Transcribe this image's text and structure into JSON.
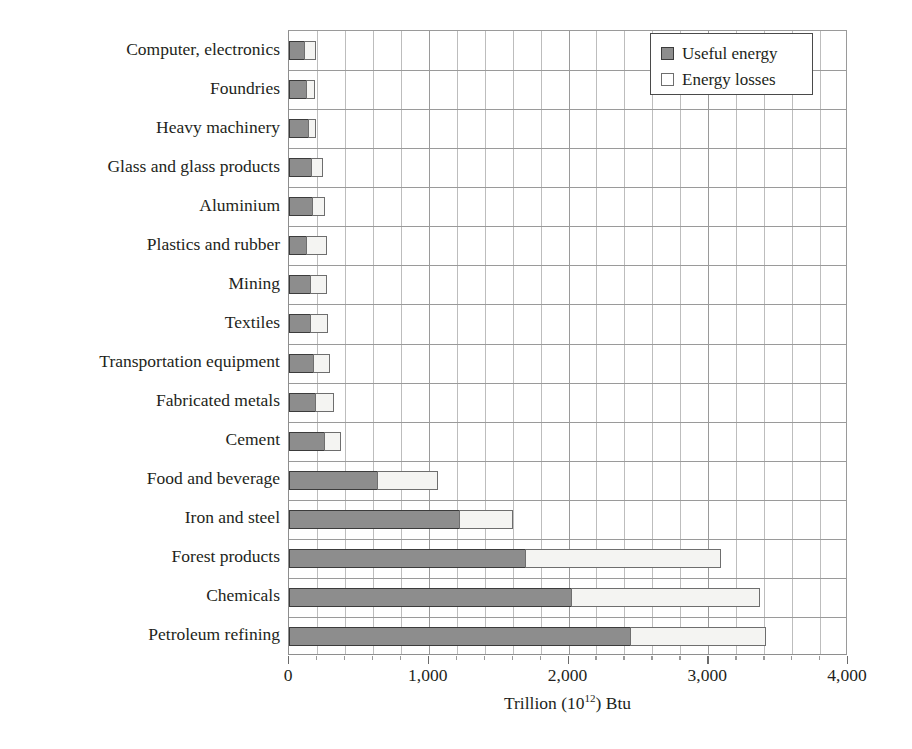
{
  "chart_data": {
    "type": "bar",
    "orientation": "horizontal",
    "stacked": true,
    "title": "",
    "xlabel": "Trillion (10¹²) Btu",
    "ylabel": "",
    "xlim": [
      0,
      4000
    ],
    "xticks": [
      0,
      1000,
      2000,
      3000,
      4000
    ],
    "xticklabels": [
      "0",
      "1,000",
      "2,000",
      "3,000",
      "4,000"
    ],
    "minor_tick_interval": 200,
    "grid": "both-axes",
    "legend_position": "top-right",
    "categories": [
      "Computer, electronics",
      "Foundries",
      "Heavy machinery",
      "Glass and glass products",
      "Aluminium",
      "Plastics and rubber",
      "Mining",
      "Textiles",
      "Transportation equipment",
      "Fabricated metals",
      "Cement",
      "Food and beverage",
      "Iron and steel",
      "Forest products",
      "Chemicals",
      "Petroleum refining"
    ],
    "series": [
      {
        "name": "Useful energy",
        "color": "#8d8d8d",
        "values": [
          120,
          130,
          145,
          170,
          175,
          130,
          160,
          165,
          185,
          200,
          265,
          640,
          1230,
          1700,
          2030,
          2450
        ]
      },
      {
        "name": "Energy losses",
        "color": "#f4f4f2",
        "values": [
          75,
          55,
          45,
          70,
          85,
          145,
          110,
          115,
          105,
          125,
          110,
          425,
          370,
          1390,
          1340,
          960
        ]
      }
    ],
    "totals": [
      195,
      185,
      190,
      240,
      260,
      275,
      270,
      280,
      290,
      325,
      375,
      1065,
      1600,
      3090,
      3370,
      3410
    ]
  },
  "legend": {
    "items": [
      {
        "label": "Useful energy",
        "swatch": "filled-square-dark"
      },
      {
        "label": "Energy losses",
        "swatch": "open-square-light"
      }
    ]
  },
  "axis": {
    "x_title_main": "Trillion (10",
    "x_title_sup": "12",
    "x_title_tail": ") Btu"
  },
  "colors": {
    "useful_fill": "#8d8d8d",
    "useful_border": "#3b3b3b",
    "loss_fill": "#f4f4f2",
    "loss_border": "#6e6e6e",
    "grid_major": "#9a9a9a",
    "grid_minor": "#bdbdbd",
    "text": "#231f20",
    "background": "#ffffff"
  }
}
